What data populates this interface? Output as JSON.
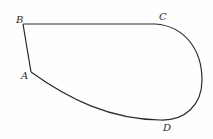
{
  "diagram": {
    "type": "closed-curve-figure",
    "stroke_color": "#2a2a2a",
    "background": "#fefefe",
    "points": {
      "A": {
        "label": "A",
        "x": 31,
        "y": 72
      },
      "B": {
        "label": "B",
        "x": 23,
        "y": 24
      },
      "C": {
        "label": "C",
        "x": 155,
        "y": 24
      },
      "D": {
        "label": "D",
        "x": 163,
        "y": 120
      }
    },
    "segments": [
      {
        "from": "A",
        "to": "B",
        "kind": "straight"
      },
      {
        "from": "B",
        "to": "C",
        "kind": "straight"
      },
      {
        "from": "C",
        "to": "D",
        "kind": "curve"
      },
      {
        "from": "D",
        "to": "A",
        "kind": "curve"
      }
    ]
  }
}
